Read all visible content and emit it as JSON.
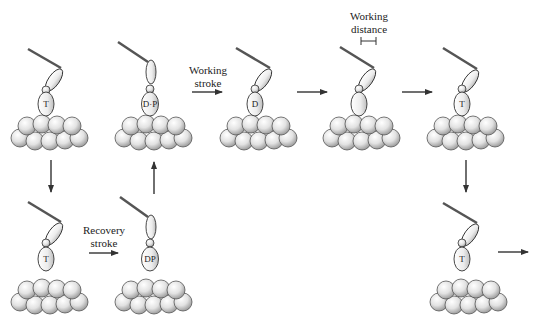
{
  "diagram": {
    "type": "myosin cross-bridge cycle",
    "states": [
      {
        "id": "s1",
        "nucleotide": "T",
        "position": "top-1",
        "head": "bent",
        "bound": true
      },
      {
        "id": "s2",
        "nucleotide": "D·P",
        "position": "top-2",
        "head": "upright",
        "bound": true
      },
      {
        "id": "s3",
        "nucleotide": "D",
        "position": "top-3",
        "head": "bent",
        "bound": true
      },
      {
        "id": "s4",
        "nucleotide": "",
        "position": "top-4",
        "head": "bent",
        "bound": true
      },
      {
        "id": "s5",
        "nucleotide": "T",
        "position": "top-5",
        "head": "bent",
        "bound": true
      },
      {
        "id": "s6",
        "nucleotide": "T",
        "position": "bottom-1",
        "head": "bent",
        "bound": false
      },
      {
        "id": "s7",
        "nucleotide": "DP",
        "position": "bottom-2",
        "head": "upright",
        "bound": false
      },
      {
        "id": "s8",
        "nucleotide": "T",
        "position": "bottom-5",
        "head": "bent",
        "bound": false
      }
    ],
    "labels": {
      "working_stroke_line1": "Working",
      "working_stroke_line2": "stroke",
      "working_distance_line1": "Working",
      "working_distance_line2": "distance",
      "recovery_stroke_line1": "Recovery",
      "recovery_stroke_line2": "stroke"
    },
    "nucleotides": {
      "s1": "T",
      "s2": "D·P",
      "s3": "D",
      "s5": "T",
      "s6": "T",
      "s7": "DP",
      "s8": "T"
    },
    "arrows": [
      {
        "from": "s1",
        "to": "s6",
        "direction": "down"
      },
      {
        "from": "s6",
        "to": "s7",
        "direction": "right",
        "label": "Recovery stroke"
      },
      {
        "from": "s7",
        "to": "s2",
        "direction": "up"
      },
      {
        "from": "s2",
        "to": "s3",
        "direction": "right",
        "label": "Working stroke"
      },
      {
        "from": "s3",
        "to": "s4",
        "direction": "right"
      },
      {
        "from": "s4",
        "to": "s5",
        "direction": "right"
      },
      {
        "from": "s5",
        "to": "s8",
        "direction": "down"
      },
      {
        "from": "s8",
        "to": "next",
        "direction": "right"
      }
    ],
    "colors": {
      "background": "#ffffff",
      "stroke": "#333333",
      "sphere_highlight": "#ffffff",
      "sphere_shadow": "#9a9a9a"
    }
  }
}
